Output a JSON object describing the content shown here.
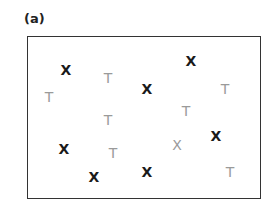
{
  "panel": {
    "label": "(a)"
  },
  "colors": {
    "dark": "#1a1a1a",
    "light": "#9a9a9a",
    "frame": "#333333"
  },
  "items": [
    {
      "glyph": "X",
      "shade": "dark",
      "x": 66,
      "y": 70
    },
    {
      "glyph": "T",
      "shade": "light",
      "x": 49,
      "y": 97
    },
    {
      "glyph": "T",
      "shade": "light",
      "x": 108,
      "y": 78
    },
    {
      "glyph": "X",
      "shade": "dark",
      "x": 147,
      "y": 89
    },
    {
      "glyph": "X",
      "shade": "dark",
      "x": 191,
      "y": 61
    },
    {
      "glyph": "T",
      "shade": "light",
      "x": 225,
      "y": 89
    },
    {
      "glyph": "T",
      "shade": "light",
      "x": 108,
      "y": 120
    },
    {
      "glyph": "T",
      "shade": "light",
      "x": 186,
      "y": 111
    },
    {
      "glyph": "X",
      "shade": "dark",
      "x": 64,
      "y": 149
    },
    {
      "glyph": "T",
      "shade": "light",
      "x": 113,
      "y": 153
    },
    {
      "glyph": "X",
      "shade": "light",
      "x": 177,
      "y": 145
    },
    {
      "glyph": "X",
      "shade": "dark",
      "x": 216,
      "y": 136
    },
    {
      "glyph": "X",
      "shade": "dark",
      "x": 94,
      "y": 177
    },
    {
      "glyph": "X",
      "shade": "dark",
      "x": 147,
      "y": 172
    },
    {
      "glyph": "T",
      "shade": "light",
      "x": 230,
      "y": 172
    }
  ]
}
